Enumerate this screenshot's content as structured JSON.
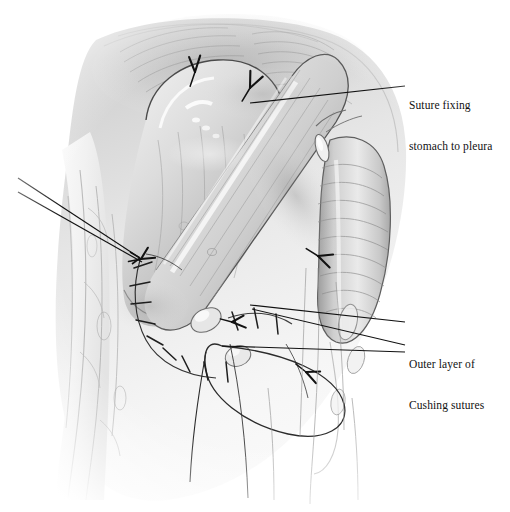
{
  "figure": {
    "medium": "graphite pencil drawing",
    "background_color": "#ffffff",
    "ink_color": "#111111",
    "width": 510,
    "height": 512
  },
  "labels": [
    {
      "id": "suture-fixing-stomach-to-pleura",
      "line1": "Suture fixing",
      "line2": "stomach to pleura",
      "x": 409,
      "y": 72,
      "leader_from": [
        405,
        86
      ],
      "leader_to": [
        250,
        103
      ]
    },
    {
      "id": "outer-layer-of-cushing-sutures",
      "line1": "Outer layer of",
      "line2": "Cushing sutures",
      "x": 409,
      "y": 331,
      "leader_from": [
        405,
        345
      ],
      "leader_to": [
        248,
        306
      ]
    }
  ],
  "annotations": {
    "leader_lines": [
      {
        "name": "pleura-leader",
        "points": "405,86 250,103"
      },
      {
        "name": "cushing-leader-upper",
        "points": "405,322 250,305"
      },
      {
        "name": "cushing-leader-lower",
        "points": "405,345 252,309"
      },
      {
        "name": "left-pointer-upper",
        "points": "18,178 140,258"
      },
      {
        "name": "left-pointer-lower",
        "points": "18,192 142,262"
      },
      {
        "name": "anastomosis-pointer",
        "points": "405,352 222,346"
      }
    ],
    "suture_knots": [
      {
        "name": "knot-dome-left",
        "x": 195,
        "y": 72,
        "rot": -18
      },
      {
        "name": "knot-dome-right",
        "x": 250,
        "y": 88,
        "rot": 8
      },
      {
        "name": "knot-right-mid",
        "x": 318,
        "y": 256,
        "rot": 92
      },
      {
        "name": "knot-anast-a",
        "x": 232,
        "y": 322,
        "rot": 70
      },
      {
        "name": "knot-anast-b",
        "x": 306,
        "y": 372,
        "rot": 96
      },
      {
        "name": "knot-left-seam",
        "x": 141,
        "y": 259,
        "rot": 40
      }
    ],
    "suture_row": {
      "name": "interrupted-suture-row",
      "description": "curved row of interrupted sutures along left gastric seam",
      "count": 9
    },
    "thread_loop": {
      "name": "free-suture-thread-loop",
      "description": "long loop of suture thread hanging below anastomosis"
    }
  },
  "anatomy": [
    {
      "name": "stomach-fundus",
      "region": "upper-left dome"
    },
    {
      "name": "gastric-tube",
      "region": "central diagonal tube"
    },
    {
      "name": "esophagus-segmented",
      "region": "right ribbed tube"
    },
    {
      "name": "pleura-chest-wall",
      "region": "background"
    },
    {
      "name": "vessels-left",
      "region": "left margin strands"
    }
  ]
}
